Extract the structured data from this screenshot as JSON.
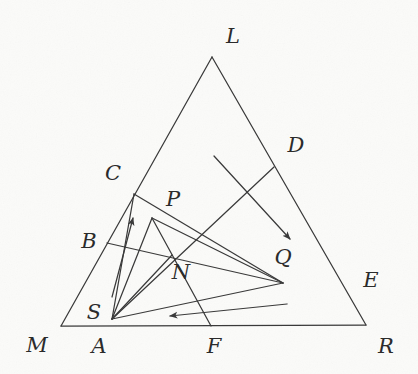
{
  "figure": {
    "stroke_color": "#3a3a3a",
    "background_color": "#fbfbf9",
    "label_color": "#2b2b2b",
    "width": 418,
    "height": 374
  },
  "labels": [
    {
      "id": "L",
      "text": "L",
      "x": 233,
      "y": 36
    },
    {
      "id": "D",
      "text": "D",
      "x": 296,
      "y": 145
    },
    {
      "id": "C",
      "text": "C",
      "x": 113,
      "y": 173
    },
    {
      "id": "P",
      "text": "P",
      "x": 173,
      "y": 199
    },
    {
      "id": "B",
      "text": "B",
      "x": 89,
      "y": 241
    },
    {
      "id": "Q",
      "text": "Q",
      "x": 283,
      "y": 257
    },
    {
      "id": "E",
      "text": "E",
      "x": 371,
      "y": 280
    },
    {
      "id": "N",
      "text": "N",
      "x": 181,
      "y": 272
    },
    {
      "id": "S",
      "text": "S",
      "x": 94,
      "y": 312
    },
    {
      "id": "M",
      "text": "M",
      "x": 37,
      "y": 345
    },
    {
      "id": "A",
      "text": "A",
      "x": 99,
      "y": 346
    },
    {
      "id": "F",
      "text": "F",
      "x": 214,
      "y": 346
    },
    {
      "id": "R",
      "text": "R",
      "x": 386,
      "y": 346
    }
  ],
  "points": {
    "M": {
      "x": 61,
      "y": 326
    },
    "L": {
      "x": 212,
      "y": 57
    },
    "R": {
      "x": 366,
      "y": 325
    },
    "C": {
      "x": 134,
      "y": 194
    },
    "B": {
      "x": 107,
      "y": 243
    },
    "S": {
      "x": 112,
      "y": 319
    },
    "A": {
      "x": 101,
      "y": 326
    },
    "P": {
      "x": 152,
      "y": 218
    },
    "N": {
      "x": 172,
      "y": 255
    },
    "F": {
      "x": 211,
      "y": 326
    },
    "D": {
      "x": 274,
      "y": 167
    },
    "E": {
      "x": 283,
      "y": 283
    },
    "Q": {
      "x": 289,
      "y": 239
    }
  },
  "segments": [
    {
      "name": "side-ML",
      "from": "M",
      "to": "L"
    },
    {
      "name": "side-LR",
      "from": "L",
      "to": "R"
    },
    {
      "name": "side-MR",
      "from": "M",
      "to": "R"
    },
    {
      "name": "cevian-S-C",
      "from": "S",
      "to": "C"
    },
    {
      "name": "cevian-S-P",
      "from": "S",
      "to": "P"
    },
    {
      "name": "cevian-S-N",
      "from": "S",
      "to": "N"
    },
    {
      "name": "cevian-S-E",
      "from": "S",
      "to": "E"
    },
    {
      "name": "chord-C-E",
      "from": "C",
      "to": "E"
    },
    {
      "name": "chord-B-E",
      "from": "B",
      "to": "E"
    },
    {
      "name": "chord-P-E",
      "from": "P",
      "to": "E"
    },
    {
      "name": "chord-P-F",
      "from": "P",
      "to": "F"
    },
    {
      "name": "chord-D-S",
      "from": "D",
      "to": "S"
    }
  ],
  "arrows": [
    {
      "name": "arrow-up-left",
      "from_x": 112,
      "from_y": 297,
      "to_x": 133,
      "to_y": 218,
      "direction": "up"
    },
    {
      "name": "arrow-down-right",
      "from_x": 214,
      "from_y": 156,
      "to_x": 290,
      "to_y": 239,
      "direction": "down-right"
    },
    {
      "name": "arrow-left-bottom",
      "from_x": 287,
      "from_y": 304,
      "to_x": 170,
      "to_y": 316,
      "direction": "left"
    }
  ],
  "chart_data": {
    "type": "diagram",
    "vertices": [
      "M",
      "L",
      "R"
    ],
    "interior_points": [
      "A",
      "S",
      "B",
      "C",
      "P",
      "N",
      "F",
      "D",
      "E",
      "Q"
    ],
    "annotations": [
      "arrow-up-left",
      "arrow-down-right",
      "arrow-left-bottom"
    ]
  }
}
